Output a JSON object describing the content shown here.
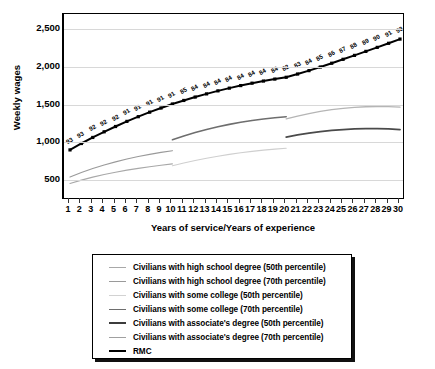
{
  "chart_data": {
    "type": "line",
    "title": "",
    "xlabel": "Years of service/Years of experience",
    "ylabel": "Weekly wages",
    "xlim": [
      1,
      30
    ],
    "ylim": [
      250,
      2700
    ],
    "yticks": [
      "500",
      "1,000",
      "1,500",
      "2,000",
      "2,500"
    ],
    "ytick_values": [
      500,
      1000,
      1500,
      2000,
      2500
    ],
    "xticks": [
      "1",
      "2",
      "3",
      "4",
      "5",
      "6",
      "7",
      "8",
      "9",
      "10",
      "11",
      "12",
      "13",
      "14",
      "15",
      "16",
      "17",
      "18",
      "19",
      "20",
      "21",
      "22",
      "23",
      "24",
      "25",
      "26",
      "27",
      "28",
      "29",
      "30"
    ],
    "grid": "horizontal",
    "legend_position": "below",
    "series": [
      {
        "name": "Civilians with high school degree (50th percentile)",
        "color": "#a8a8a8",
        "width": 1.1,
        "x": [
          1,
          2,
          3,
          4,
          5,
          6,
          7,
          8,
          9,
          10
        ],
        "values": [
          455,
          500,
          540,
          575,
          605,
          632,
          656,
          678,
          697,
          715
        ]
      },
      {
        "name": "Civilians with high school degree (70th percentile)",
        "color": "#9a9a9a",
        "width": 1.1,
        "x": [
          1,
          2,
          3,
          4,
          5,
          6,
          7,
          8,
          9,
          10
        ],
        "values": [
          540,
          600,
          653,
          700,
          742,
          779,
          812,
          841,
          867,
          890
        ]
      },
      {
        "name": "Civilians with some college (50th percentile)",
        "color": "#cfcfcf",
        "width": 1.1,
        "x": [
          10,
          11,
          12,
          13,
          14,
          15,
          16,
          17,
          18,
          19,
          20
        ],
        "values": [
          690,
          727,
          760,
          790,
          817,
          841,
          862,
          881,
          897,
          911,
          922
        ]
      },
      {
        "name": "Civilians with some college (70th percentile)",
        "color": "#6e6e6e",
        "width": 1.6,
        "x": [
          10,
          11,
          12,
          13,
          14,
          15,
          16,
          17,
          18,
          19,
          20
        ],
        "values": [
          1035,
          1085,
          1130,
          1170,
          1206,
          1238,
          1266,
          1290,
          1310,
          1327,
          1340
        ]
      },
      {
        "name": "Civilians with associate's degree (50th percentile)",
        "color": "#4a4a4a",
        "width": 1.8,
        "x": [
          20,
          21,
          22,
          23,
          24,
          25,
          26,
          27,
          28,
          29,
          30
        ],
        "values": [
          1070,
          1098,
          1122,
          1142,
          1158,
          1170,
          1178,
          1182,
          1182,
          1178,
          1170
        ]
      },
      {
        "name": "Civilians with associate's degree (70th percentile)",
        "color": "#b5b5b5",
        "width": 1.3,
        "x": [
          20,
          21,
          22,
          23,
          24,
          25,
          26,
          27,
          28,
          29,
          30
        ],
        "values": [
          1310,
          1348,
          1382,
          1410,
          1433,
          1451,
          1464,
          1472,
          1475,
          1473,
          1466
        ]
      },
      {
        "name": "RMC",
        "color": "#000000",
        "width": 2.0,
        "markers": true,
        "x": [
          1,
          2,
          3,
          4,
          5,
          6,
          7,
          8,
          9,
          10,
          11,
          12,
          13,
          14,
          15,
          16,
          17,
          18,
          19,
          20,
          21,
          22,
          23,
          24,
          25,
          26,
          27,
          28,
          29,
          30
        ],
        "values": [
          900,
          985,
          1065,
          1140,
          1210,
          1278,
          1340,
          1400,
          1455,
          1508,
          1555,
          1600,
          1642,
          1682,
          1718,
          1752,
          1784,
          1812,
          1838,
          1862,
          1905,
          1950,
          1998,
          2048,
          2100,
          2152,
          2205,
          2258,
          2312,
          2368
        ],
        "point_labels": [
          "93",
          "93",
          "92",
          "92",
          "92",
          "91",
          "91",
          "91",
          "91",
          "91",
          "85",
          "84",
          "84",
          "84",
          "84",
          "84",
          "84",
          "84",
          "84",
          "82",
          "83",
          "84",
          "85",
          "86",
          "87",
          "88",
          "89",
          "90",
          "91",
          "93"
        ]
      }
    ]
  },
  "legend": {
    "items": [
      {
        "label": "Civilians with high school degree (50th percentile)",
        "color": "#a8a8a8",
        "width": 1.6
      },
      {
        "label": "Civilians with high school degree (70th percentile)",
        "color": "#9a9a9a",
        "width": 1.6
      },
      {
        "label": "Civilians with some college (50th percentile)",
        "color": "#d2d2d2",
        "width": 1.6
      },
      {
        "label": "Civilians with some college (70th percentile)",
        "color": "#6e6e6e",
        "width": 1.8
      },
      {
        "label": "Civilians with associate's degree (50th percentile)",
        "color": "#3c3c3c",
        "width": 2.2
      },
      {
        "label": "Civilians with associate's degree (70th percentile)",
        "color": "#a0a0a0",
        "width": 1.6
      },
      {
        "label": "RMC",
        "color": "#000000",
        "width": 2.6
      }
    ]
  }
}
